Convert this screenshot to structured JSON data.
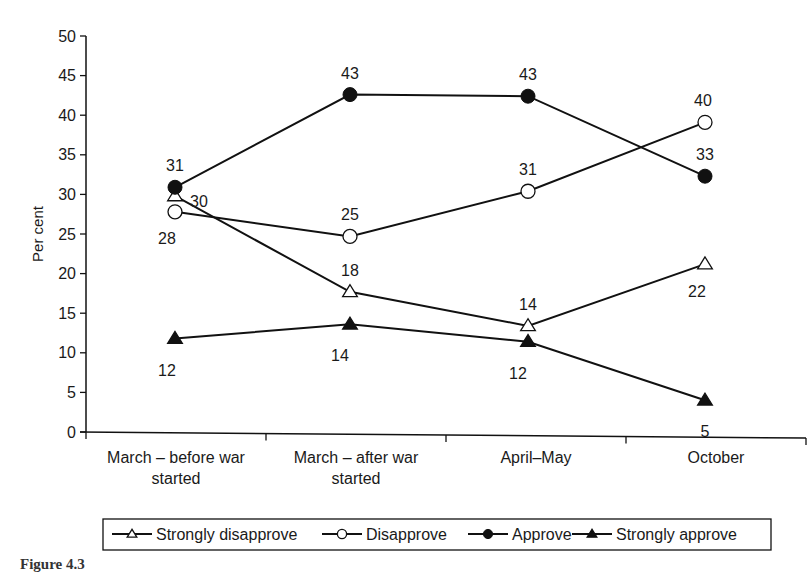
{
  "chart_data": {
    "type": "line",
    "title": "",
    "xlabel": "",
    "ylabel": "Per cent",
    "ylim": [
      0,
      50
    ],
    "yticks": [
      0,
      5,
      10,
      15,
      20,
      25,
      30,
      35,
      40,
      45,
      50
    ],
    "grid": false,
    "legend_position": "bottom",
    "categories": [
      [
        "March – before war",
        "started"
      ],
      [
        "March – after war",
        "started"
      ],
      [
        "April–May"
      ],
      [
        "October"
      ]
    ],
    "series": [
      {
        "name": "Strongly disapprove",
        "marker": "triangle-open",
        "values": [
          30,
          18,
          14,
          22
        ]
      },
      {
        "name": "Disapprove",
        "marker": "circle-open",
        "values": [
          28,
          25,
          31,
          40
        ]
      },
      {
        "name": "Approve",
        "marker": "circle-filled",
        "values": [
          31,
          43,
          43,
          33
        ]
      },
      {
        "name": "Strongly approve",
        "marker": "triangle-filled",
        "values": [
          12,
          14,
          12,
          5
        ]
      }
    ],
    "plotted_positions": {
      "Strongly disapprove": [
        29.8,
        17.7,
        13.4,
        21.2
      ],
      "Disapprove": [
        27.8,
        24.7,
        30.4,
        39.1
      ],
      "Approve": [
        30.9,
        42.6,
        42.4,
        32.3
      ],
      "Strongly approve": [
        11.8,
        13.6,
        11.4,
        4.0
      ]
    },
    "data_labels": [
      {
        "series": "Strongly disapprove",
        "labels": [
          "30",
          "18",
          "14",
          "22"
        ]
      },
      {
        "series": "Disapprove",
        "labels": [
          "28",
          "25",
          "31",
          "40"
        ]
      },
      {
        "series": "Approve",
        "labels": [
          "31",
          "43",
          "43",
          "33"
        ]
      },
      {
        "series": "Strongly approve",
        "labels": [
          "12",
          "14",
          "12",
          "5"
        ]
      }
    ],
    "colors": {
      "line": "#111111",
      "background": "#ffffff"
    }
  },
  "caption": {
    "prefix": "Figure 4.3",
    "text": ""
  }
}
